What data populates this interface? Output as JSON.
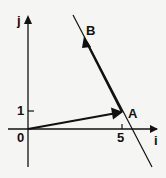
{
  "diagram": {
    "axes": {
      "x_label": "i",
      "y_label": "j",
      "origin_label": "0"
    },
    "ticks": {
      "x_tick": "5",
      "y_tick": "1"
    },
    "points": [
      {
        "name": "A",
        "coords": [
          5,
          1
        ]
      },
      {
        "name": "B"
      }
    ],
    "vectors": [
      {
        "from": "0",
        "to": "A"
      },
      {
        "from": "A",
        "to": "B"
      }
    ],
    "line": {
      "through": [
        "A",
        "B"
      ]
    }
  }
}
